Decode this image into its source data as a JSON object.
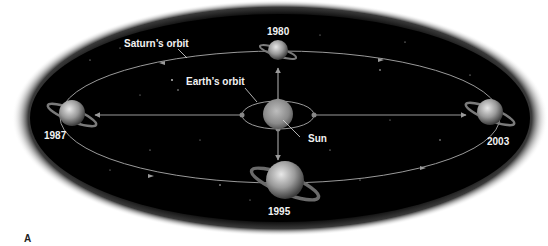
{
  "figure": {
    "panel_label": "A",
    "labels": {
      "saturn_orbit": "Saturn’s orbit",
      "earth_orbit": "Earth’s orbit",
      "sun": "Sun"
    },
    "saturn_positions": [
      {
        "year": "1980",
        "position": "top"
      },
      {
        "year": "1987",
        "position": "left"
      },
      {
        "year": "1995",
        "position": "bottom"
      },
      {
        "year": "2003",
        "position": "right"
      }
    ],
    "colors": {
      "space": "#000000",
      "orbit_line": "#9a9a9a",
      "label_text": "#f2f2f2",
      "background": "#ffffff"
    }
  }
}
